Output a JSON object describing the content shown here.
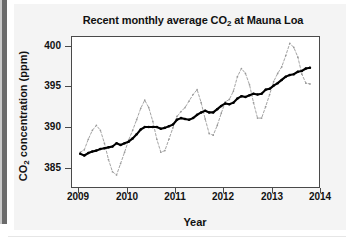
{
  "figure": {
    "title_prefix": "Recent monthly average CO",
    "title_sub": "2",
    "title_suffix": " at Mauna Loa",
    "y_axis_prefix": "CO",
    "y_axis_sub": "2",
    "y_axis_suffix": " concentration (ppm)",
    "x_axis_title": "Year"
  },
  "chart_data": {
    "type": "line",
    "title": "Recent monthly average CO2 at Mauna Loa",
    "xlabel": "Year",
    "ylabel": "CO2 concentration (ppm)",
    "xlim": [
      2008.85,
      2014.0
    ],
    "ylim": [
      382.5,
      401.2
    ],
    "xticks": [
      2009,
      2010,
      2011,
      2012,
      2013,
      2014
    ],
    "xtick_labels": [
      "2009",
      "2010",
      "2011",
      "2012",
      "2013",
      "2014"
    ],
    "yticks": [
      385,
      390,
      395,
      400
    ],
    "ytick_labels": [
      "385",
      "390",
      "395",
      "400"
    ],
    "grid": false,
    "legend": "none",
    "series": [
      {
        "name": "monthly average",
        "style": "dashed",
        "color": "#9a9a9a",
        "marker": "dot",
        "x": [
          2009.042,
          2009.125,
          2009.208,
          2009.292,
          2009.375,
          2009.458,
          2009.542,
          2009.625,
          2009.708,
          2009.792,
          2009.875,
          2009.958,
          2010.042,
          2010.125,
          2010.208,
          2010.292,
          2010.375,
          2010.458,
          2010.542,
          2010.625,
          2010.708,
          2010.792,
          2010.875,
          2010.958,
          2011.042,
          2011.125,
          2011.208,
          2011.292,
          2011.375,
          2011.458,
          2011.542,
          2011.625,
          2011.708,
          2011.792,
          2011.875,
          2011.958,
          2012.042,
          2012.125,
          2012.208,
          2012.292,
          2012.375,
          2012.458,
          2012.542,
          2012.625,
          2012.708,
          2012.792,
          2012.875,
          2012.958,
          2013.042,
          2013.125,
          2013.208,
          2013.292,
          2013.375,
          2013.458,
          2013.542,
          2013.625,
          2013.708,
          2013.792
        ],
        "y": [
          386.9,
          387.2,
          388.5,
          389.6,
          390.2,
          389.6,
          388.0,
          386.0,
          384.5,
          384.1,
          385.5,
          386.9,
          388.4,
          389.6,
          390.9,
          392.3,
          393.3,
          392.4,
          390.7,
          388.5,
          386.9,
          387.1,
          388.5,
          389.9,
          391.3,
          391.9,
          392.4,
          393.2,
          394.0,
          394.6,
          393.0,
          391.0,
          389.2,
          389.0,
          390.2,
          391.7,
          393.1,
          393.4,
          394.4,
          396.2,
          397.2,
          396.6,
          395.2,
          393.0,
          391.1,
          391.1,
          392.5,
          394.0,
          395.6,
          396.6,
          397.4,
          398.8,
          400.3,
          399.8,
          398.6,
          396.5,
          395.4,
          395.3
        ]
      },
      {
        "name": "trend (seasonally corrected)",
        "style": "solid",
        "color": "#000000",
        "marker": "dot",
        "x": [
          2009.042,
          2009.125,
          2009.208,
          2009.292,
          2009.375,
          2009.458,
          2009.542,
          2009.625,
          2009.708,
          2009.792,
          2009.875,
          2009.958,
          2010.042,
          2010.125,
          2010.208,
          2010.292,
          2010.375,
          2010.458,
          2010.542,
          2010.625,
          2010.708,
          2010.792,
          2010.875,
          2010.958,
          2011.042,
          2011.125,
          2011.208,
          2011.292,
          2011.375,
          2011.458,
          2011.542,
          2011.625,
          2011.708,
          2011.792,
          2011.875,
          2011.958,
          2012.042,
          2012.125,
          2012.208,
          2012.292,
          2012.375,
          2012.458,
          2012.542,
          2012.625,
          2012.708,
          2012.792,
          2012.875,
          2012.958,
          2013.042,
          2013.125,
          2013.208,
          2013.292,
          2013.375,
          2013.458,
          2013.542,
          2013.625,
          2013.708,
          2013.792
        ],
        "y": [
          386.7,
          386.5,
          386.8,
          387.0,
          387.1,
          387.3,
          387.4,
          387.5,
          387.6,
          388.0,
          387.8,
          388.0,
          388.2,
          388.6,
          389.1,
          389.7,
          390.0,
          390.0,
          390.0,
          390.0,
          389.8,
          389.9,
          390.1,
          390.3,
          390.9,
          391.1,
          391.0,
          390.9,
          391.1,
          391.5,
          391.8,
          392.0,
          391.8,
          391.8,
          392.2,
          392.6,
          392.9,
          392.8,
          393.0,
          393.5,
          393.8,
          393.7,
          393.9,
          394.1,
          394.0,
          394.1,
          394.6,
          394.7,
          395.1,
          395.4,
          395.8,
          396.2,
          396.4,
          396.5,
          396.8,
          396.9,
          397.2,
          397.3
        ]
      }
    ]
  }
}
